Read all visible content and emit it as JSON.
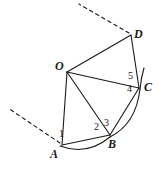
{
  "figure": {
    "type": "geometry-diagram",
    "width": 159,
    "height": 172,
    "background_color": "#ffffff",
    "stroke_color": "#1a1a1a"
  },
  "points": [
    {
      "id": "O",
      "label": "O",
      "x": 67,
      "y": 72,
      "label_x": 55,
      "label_y": 60
    },
    {
      "id": "A",
      "label": "A",
      "x": 62,
      "y": 145,
      "label_x": 50,
      "label_y": 148
    },
    {
      "id": "B",
      "label": "B",
      "x": 110,
      "y": 135,
      "label_x": 108,
      "label_y": 138
    },
    {
      "id": "C",
      "label": "C",
      "x": 139,
      "y": 88,
      "label_x": 144,
      "label_y": 81
    },
    {
      "id": "D",
      "label": "D",
      "x": 131,
      "y": 35,
      "label_x": 134,
      "label_y": 28
    }
  ],
  "angle_labels": [
    {
      "id": "angle-1",
      "label": "1",
      "x": 59,
      "y": 129
    },
    {
      "id": "angle-2",
      "label": "2",
      "x": 94,
      "y": 122
    },
    {
      "id": "angle-3",
      "label": "3",
      "x": 104,
      "y": 118
    },
    {
      "id": "angle-4",
      "label": "4",
      "x": 127,
      "y": 84
    },
    {
      "id": "angle-5",
      "label": "5",
      "x": 128,
      "y": 71
    }
  ],
  "segments": [
    {
      "id": "segment-OA",
      "from": "O",
      "to": "A"
    },
    {
      "id": "segment-OB",
      "from": "O",
      "to": "B"
    },
    {
      "id": "segment-OC",
      "from": "O",
      "to": "C"
    },
    {
      "id": "segment-OD",
      "from": "O",
      "to": "D"
    },
    {
      "id": "segment-AB",
      "from": "A",
      "to": "B"
    },
    {
      "id": "segment-BC",
      "from": "B",
      "to": "C"
    },
    {
      "id": "segment-CD",
      "from": "C",
      "to": "D"
    }
  ],
  "arcs": [
    {
      "id": "arc-AB",
      "from": "A",
      "to": "B",
      "note": "arc bulging outward below chord AB"
    },
    {
      "id": "arc-BC",
      "from": "B",
      "to": "C",
      "note": "arc bulging outward right of chord BC"
    },
    {
      "id": "arc-C-extension",
      "from": "C",
      "to": "above-C",
      "note": "arc continues past C toward D side"
    }
  ],
  "dashed_rays": [
    {
      "id": "dashed-ray-lower-left",
      "note": "extension of ray OA beyond A toward upper-left"
    },
    {
      "id": "dashed-ray-upper",
      "note": "extension of ray OD beyond D toward upper-left"
    }
  ]
}
